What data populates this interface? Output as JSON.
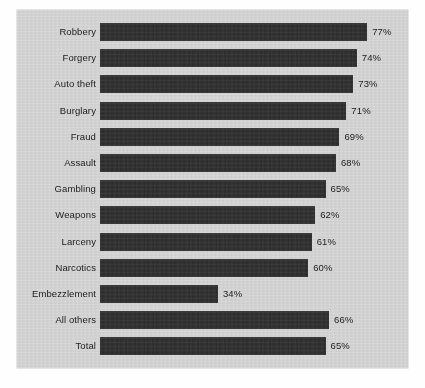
{
  "chart_data": {
    "type": "bar",
    "orientation": "horizontal",
    "title": "",
    "subtitle": "",
    "xlabel": "",
    "ylabel": "",
    "xlim": [
      0,
      80
    ],
    "grid": false,
    "legend": null,
    "value_suffix": "%",
    "categories": [
      "Robbery",
      "Forgery",
      "Auto theft",
      "Burglary",
      "Fraud",
      "Assault",
      "Gambling",
      "Weapons",
      "Larceny",
      "Narcotics",
      "Embezzlement",
      "All others",
      "Total"
    ],
    "values": [
      77,
      74,
      73,
      71,
      69,
      68,
      65,
      62,
      61,
      60,
      34,
      66,
      65
    ],
    "value_labels": [
      "77%",
      "74%",
      "73%",
      "71%",
      "69%",
      "68%",
      "65%",
      "62%",
      "61%",
      "60%",
      "34%",
      "66%",
      "65%"
    ],
    "bars": [
      {
        "category": "Robbery",
        "value": 77,
        "label": "77%"
      },
      {
        "category": "Forgery",
        "value": 74,
        "label": "74%"
      },
      {
        "category": "Auto theft",
        "value": 73,
        "label": "73%"
      },
      {
        "category": "Burglary",
        "value": 71,
        "label": "71%"
      },
      {
        "category": "Fraud",
        "value": 69,
        "label": "69%"
      },
      {
        "category": "Assault",
        "value": 68,
        "label": "68%"
      },
      {
        "category": "Gambling",
        "value": 65,
        "label": "65%"
      },
      {
        "category": "Weapons",
        "value": 62,
        "label": "62%"
      },
      {
        "category": "Larceny",
        "value": 61,
        "label": "61%"
      },
      {
        "category": "Narcotics",
        "value": 60,
        "label": "60%"
      },
      {
        "category": "Embezzlement",
        "value": 34,
        "label": "34%"
      },
      {
        "category": "All others",
        "value": 66,
        "label": "66%"
      },
      {
        "category": "Total",
        "value": 65,
        "label": "65%"
      }
    ]
  },
  "style": {
    "panel_background": "#d4d4d4",
    "figure_background": "#ffffff",
    "bar_color": "#2e2e2e",
    "text_color": "#1b1b1b"
  }
}
